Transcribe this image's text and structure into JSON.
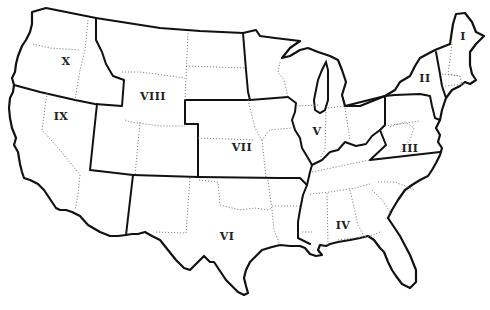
{
  "map": {
    "subject": "Contiguous United States divided into ten federal regions",
    "style": {
      "background": "#ffffff",
      "outline_color": "#111111",
      "state_border_color": "#777777",
      "region_border": "solid thick",
      "state_border": "dotted thin"
    },
    "regions": [
      {
        "id": "I",
        "label": "I",
        "x": 463,
        "y": 36
      },
      {
        "id": "II",
        "label": "II",
        "x": 425,
        "y": 78
      },
      {
        "id": "III",
        "label": "III",
        "x": 410,
        "y": 148
      },
      {
        "id": "IV",
        "label": "IV",
        "x": 343,
        "y": 225
      },
      {
        "id": "V",
        "label": "V",
        "x": 317,
        "y": 131
      },
      {
        "id": "VI",
        "label": "VI",
        "x": 227,
        "y": 236
      },
      {
        "id": "VII",
        "label": "VII",
        "x": 242,
        "y": 147
      },
      {
        "id": "VIII",
        "label": "VIII",
        "x": 153,
        "y": 96
      },
      {
        "id": "IX",
        "label": "IX",
        "x": 61,
        "y": 116
      },
      {
        "id": "X",
        "label": "X",
        "x": 66,
        "y": 61
      }
    ]
  }
}
